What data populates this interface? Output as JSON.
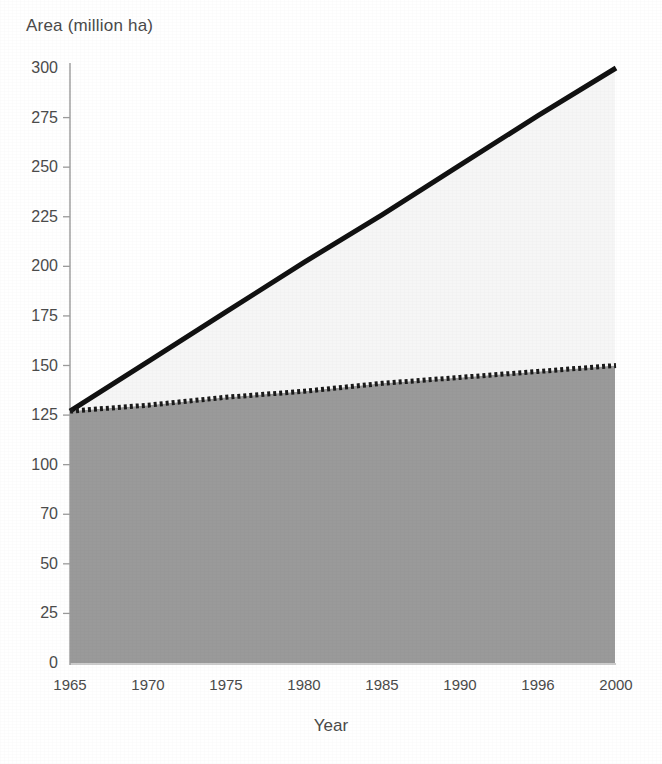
{
  "chart_data": {
    "type": "area",
    "title": "",
    "subtitle": "",
    "xlabel": "Year",
    "ylabel": "Area (million ha)",
    "x": [
      1965,
      1970,
      1975,
      1980,
      1985,
      1990,
      1995,
      2000
    ],
    "xtick_labels": [
      "1965",
      "1970",
      "1975",
      "1980",
      "1985",
      "1990",
      "1996",
      "2000"
    ],
    "ytick_labels": [
      "0",
      "25",
      "50",
      "70",
      "100",
      "125",
      "150",
      "175",
      "200",
      "225",
      "250",
      "275",
      "300"
    ],
    "ytick_values": [
      0,
      25,
      50,
      75,
      100,
      125,
      150,
      175,
      200,
      225,
      250,
      275,
      300
    ],
    "xlim": [
      1965,
      2000
    ],
    "ylim": [
      0,
      300
    ],
    "grid": false,
    "legend_position": "none",
    "series": [
      {
        "name": "Upper boundary (solid line)",
        "style": "solid",
        "color": "#111111",
        "fill_color": "#f6f6f6",
        "values": [
          127,
          152,
          177,
          202,
          226,
          251,
          276,
          300
        ]
      },
      {
        "name": "Lower boundary (dotted line)",
        "style": "dotted",
        "color": "#1a1a1a",
        "fill_color": "#9a9a9a",
        "values": [
          127,
          130,
          134,
          137,
          141,
          144,
          147,
          150
        ]
      }
    ],
    "annotations": []
  },
  "colors": {
    "lower_fill": "#9a9a9a",
    "upper_fill": "#f6f6f6",
    "line": "#111111",
    "axis": "#8d8d8d",
    "text": "#4b4b4b",
    "background": "#ffffff"
  }
}
